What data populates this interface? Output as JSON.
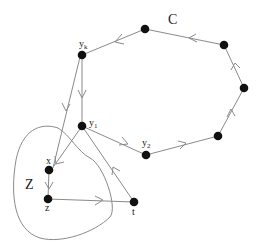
{
  "diagram": {
    "type": "directed-graph",
    "cycle_label": "C",
    "region_label": "Z",
    "colors": {
      "node": "#111111",
      "edge": "#8a8a8a",
      "label": "#222222"
    },
    "nodes": [
      {
        "id": "c1",
        "label": "",
        "x": 145,
        "y": 29
      },
      {
        "id": "c2",
        "label": "",
        "x": 224,
        "y": 45
      },
      {
        "id": "c3",
        "label": "",
        "x": 244,
        "y": 88
      },
      {
        "id": "c4",
        "label": "",
        "x": 218,
        "y": 136
      },
      {
        "id": "y2",
        "label": "y",
        "sub": "2",
        "x": 146,
        "y": 155
      },
      {
        "id": "y1",
        "label": "y",
        "sub": "1",
        "x": 82,
        "y": 126
      },
      {
        "id": "yk",
        "label": "y",
        "sub": "k",
        "x": 82,
        "y": 55
      },
      {
        "id": "x",
        "label": "x",
        "x": 49,
        "y": 170
      },
      {
        "id": "z",
        "label": "z",
        "x": 48,
        "y": 199
      },
      {
        "id": "t",
        "label": "t",
        "x": 134,
        "y": 202
      }
    ],
    "edges": [
      {
        "from": "c2",
        "to": "c1"
      },
      {
        "from": "c1",
        "to": "yk"
      },
      {
        "from": "yk",
        "to": "y1"
      },
      {
        "from": "yk",
        "to": "x"
      },
      {
        "from": "y1",
        "to": "y2"
      },
      {
        "from": "y2",
        "to": "c4"
      },
      {
        "from": "c4",
        "to": "c3"
      },
      {
        "from": "c3",
        "to": "c2"
      },
      {
        "from": "y1",
        "to": "x"
      },
      {
        "from": "x",
        "to": "z"
      },
      {
        "from": "z",
        "to": "t"
      },
      {
        "from": "t",
        "to": "y1"
      }
    ]
  }
}
